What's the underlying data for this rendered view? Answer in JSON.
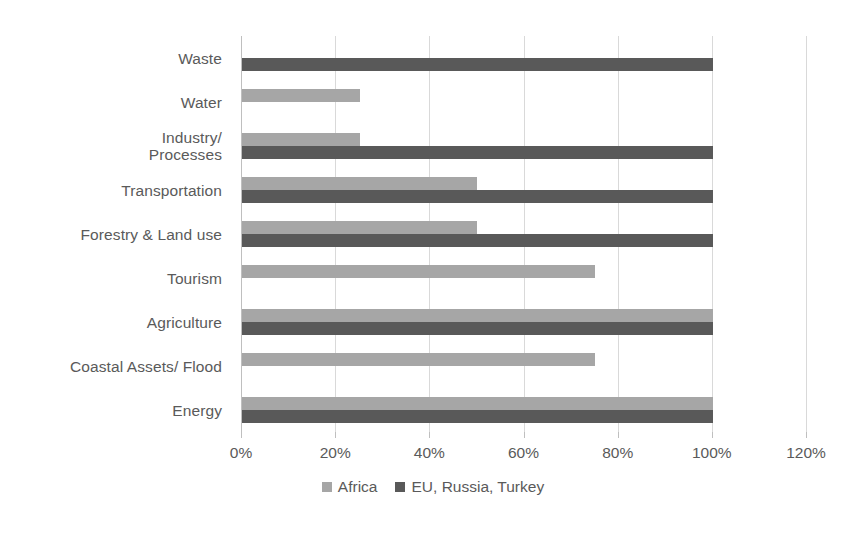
{
  "chart_data": {
    "type": "bar",
    "orientation": "horizontal",
    "title": "",
    "subtitle": "",
    "xlabel": "",
    "ylabel": "",
    "xlim": [
      0,
      120
    ],
    "xticks": [
      "0%",
      "20%",
      "40%",
      "60%",
      "80%",
      "100%",
      "120%"
    ],
    "xtick_values": [
      0,
      20,
      40,
      60,
      80,
      100,
      120
    ],
    "grid": true,
    "legend_position": "bottom",
    "categories": [
      "Waste",
      "Water",
      "Industry/\nProcesses",
      "Transportation",
      "Forestry & Land use",
      "Tourism",
      "Agriculture",
      "Coastal Assets/ Flood",
      "Energy"
    ],
    "series": [
      {
        "name": "Africa",
        "color": "#a6a6a6",
        "values": [
          0,
          25,
          25,
          50,
          50,
          75,
          100,
          75,
          100
        ]
      },
      {
        "name": "EU, Russia, Turkey",
        "color": "#595959",
        "values": [
          100,
          0,
          100,
          100,
          100,
          0,
          100,
          0,
          100
        ]
      }
    ]
  },
  "legend": {
    "items": [
      {
        "label": "Africa",
        "color": "#a6a6a6"
      },
      {
        "label": "EU, Russia, Turkey",
        "color": "#595959"
      }
    ]
  },
  "colors": {
    "africa": "#a6a6a6",
    "eu_russia_turkey": "#595959",
    "gridline": "#d9d9d9",
    "axis": "#bfbfbf",
    "text": "#5a5a5a",
    "background": "#ffffff"
  }
}
